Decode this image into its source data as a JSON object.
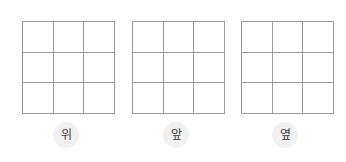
{
  "diagram": {
    "type": "orthographic-views-grid-worksheet",
    "background_color": "#ffffff",
    "grid_line_color": "#9a9a9a",
    "label_text_color": "#3a3a3a",
    "label_halo_color": "#f1f1f1",
    "grid_rows": 3,
    "grid_cols": 3,
    "views": [
      {
        "label": "위",
        "cells": [
          "",
          "",
          "",
          "",
          "",
          "",
          "",
          "",
          ""
        ]
      },
      {
        "label": "앞",
        "cells": [
          "",
          "",
          "",
          "",
          "",
          "",
          "",
          "",
          ""
        ]
      },
      {
        "label": "옆",
        "cells": [
          "",
          "",
          "",
          "",
          "",
          "",
          "",
          "",
          ""
        ]
      }
    ]
  }
}
